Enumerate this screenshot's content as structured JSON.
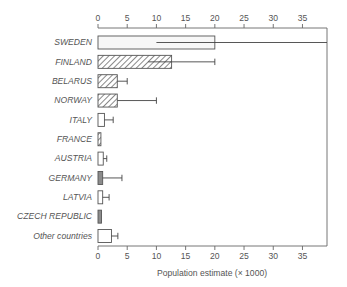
{
  "chart_data": {
    "type": "bar",
    "orientation": "horizontal",
    "title": "",
    "xlabel": "Population estimate (× 1000)",
    "ylabel": "",
    "xlim": [
      0,
      39.2
    ],
    "xticks": [
      0,
      5,
      10,
      15,
      20,
      25,
      30,
      35
    ],
    "xticklabels": [
      "0",
      "5",
      "10",
      "15",
      "20",
      "25",
      "30",
      "35"
    ],
    "grid": false,
    "legend": "none",
    "categories": [
      "SWEDEN",
      "FINLAND",
      "BELARUS",
      "NORWAY",
      "ITALY",
      "FRANCE",
      "AUSTRIA",
      "GERMANY",
      "LATVIA",
      "CZECH REPUBLIC",
      "Other countries"
    ],
    "values": [
      20.0,
      12.6,
      3.3,
      3.3,
      1.1,
      0.5,
      0.9,
      0.8,
      0.8,
      0.6,
      2.3
    ],
    "error_low": [
      10.0,
      8.6,
      3.3,
      3.3,
      1.1,
      0.5,
      0.9,
      0.8,
      0.8,
      0.6,
      2.3
    ],
    "error_high": [
      39.2,
      20.0,
      5.0,
      10.0,
      2.6,
      0.5,
      1.5,
      4.1,
      1.9,
      0.6,
      3.4
    ],
    "fills": [
      "light",
      "hatch",
      "hatch",
      "hatch",
      "white",
      "hatch",
      "white",
      "gray",
      "white",
      "gray",
      "white"
    ],
    "colors": {
      "light": "#f7f7f7",
      "white": "#ffffff",
      "gray": "#8c8c8c",
      "hatch_line": "#6b6b6b",
      "outline": "#555555",
      "axis": "#666666",
      "text": "#555555"
    }
  }
}
